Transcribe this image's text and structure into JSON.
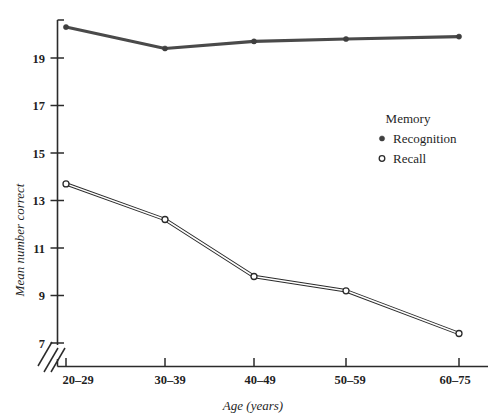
{
  "chart_data": {
    "type": "line",
    "title": "",
    "xlabel": "Age (years)",
    "ylabel": "Mean number correct",
    "categories": [
      "20–29",
      "30–39",
      "40–49",
      "50–59",
      "60–75"
    ],
    "ylim": [
      7,
      21
    ],
    "yticks": [
      7,
      9,
      11,
      13,
      15,
      17,
      19
    ],
    "grid": false,
    "axis_break": true,
    "legend_position": "inside-right",
    "legend_title": "Memory",
    "series": [
      {
        "name": "Recognition",
        "marker": "filled-circle",
        "values": [
          20.3,
          19.4,
          19.7,
          19.8,
          19.9
        ]
      },
      {
        "name": "Recall",
        "marker": "open-circle",
        "values": [
          13.7,
          12.2,
          9.8,
          9.2,
          7.4
        ]
      }
    ]
  },
  "axes": {
    "y_tick_labels": [
      "19",
      "17",
      "15",
      "13",
      "11",
      "9",
      "7"
    ],
    "x_tick_labels": [
      "20–29",
      "30–39",
      "40–49",
      "50–59",
      "60–75"
    ],
    "y_axis_title": "Mean number correct",
    "x_axis_title": "Age (years)"
  },
  "legend": {
    "title": "Memory",
    "items": [
      {
        "label": "Recognition",
        "marker": "filled-circle"
      },
      {
        "label": "Recall",
        "marker": "open-circle"
      }
    ]
  },
  "colors": {
    "recognition_line": "#4a4a4a",
    "recall_line": "#2b2b2b",
    "axis": "#2b2b2b",
    "background": "#ffffff"
  }
}
